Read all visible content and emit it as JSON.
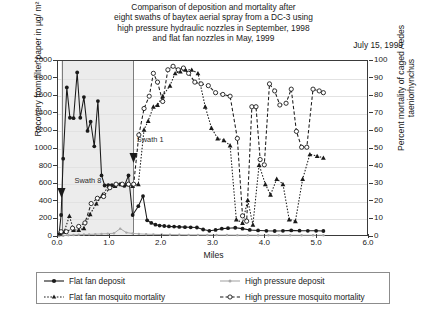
{
  "title": {
    "line1": "Comparison of deposition and mortality after",
    "line2": "eight swaths of baytex aerial spray from a DC-3 using",
    "line3": "high pressure hydraulic nozzles in September, 1998",
    "line4": "and flat fan nozzles in May, 1999"
  },
  "date_label": "July 15, 1999",
  "annotations": [
    {
      "text": "Swath 8",
      "x": 0.32,
      "y": 640
    },
    {
      "text": "Swath 1",
      "x": 1.52,
      "y": 1100
    }
  ],
  "legend": {
    "items": [
      {
        "label": "Flat fan deposit",
        "key": "solid-filled-circle",
        "color": "#1a1a1a"
      },
      {
        "label": "High pressure deposit",
        "key": "solid-grey-dot",
        "color": "#a8a8a8"
      },
      {
        "label": "Flat fan mosquito mortality",
        "key": "dotted-filled-triangle",
        "color": "#1a1a1a"
      },
      {
        "label": "High pressure mosquito mortality",
        "key": "dashed-open-circle",
        "color": "#1a1a1a"
      }
    ]
  },
  "chart_data": {
    "type": "line",
    "title": "Comparison of deposition and mortality after eight swaths of baytex aerial spray from a DC-3 using high pressure hydraulic nozzles in September, 1998 and flat fan nozzles in May, 1999",
    "xlabel": "Miles",
    "ylabel": "Recovery from filter paper in µg/ m²",
    "y2label": "Percent mortality of caged Aedes taeniorhynchus",
    "xlim": [
      0.0,
      6.0
    ],
    "ylim": [
      0,
      2000
    ],
    "y2lim": [
      0,
      100
    ],
    "xticks": [
      "0.0",
      "1.0",
      "2.0",
      "3.0",
      "4.0",
      "5.0",
      "6.0"
    ],
    "yticks": [
      0,
      200,
      400,
      600,
      800,
      1000,
      1200,
      1400,
      1600,
      1800,
      2000
    ],
    "y2ticks": [
      0,
      10,
      20,
      30,
      40,
      50,
      60,
      70,
      80,
      90,
      100
    ],
    "grid": true,
    "legend_position": "below",
    "shaded_band": {
      "x0": 0.05,
      "x1": 1.45,
      "color": "#ececec"
    },
    "swath_markers": [
      {
        "label": "Swath 8",
        "x": 0.07
      },
      {
        "label": "Swath 1",
        "x": 1.45
      }
    ],
    "series": [
      {
        "name": "Flat fan deposit",
        "axis": "left",
        "style": "solid",
        "marker": "filled-circle",
        "color": "#1a1a1a",
        "points": [
          [
            0.02,
            30
          ],
          [
            0.06,
            250
          ],
          [
            0.1,
            890
          ],
          [
            0.17,
            1700
          ],
          [
            0.23,
            1355
          ],
          [
            0.3,
            1350
          ],
          [
            0.37,
            1870
          ],
          [
            0.43,
            1355
          ],
          [
            0.5,
            1590
          ],
          [
            0.57,
            1205
          ],
          [
            0.63,
            1310
          ],
          [
            0.7,
            1030
          ],
          [
            0.77,
            1545
          ],
          [
            0.84,
            700
          ],
          [
            0.9,
            585
          ],
          [
            0.97,
            590
          ],
          [
            1.04,
            590
          ],
          [
            1.12,
            595
          ],
          [
            1.2,
            600
          ],
          [
            1.28,
            580
          ],
          [
            1.36,
            700
          ],
          [
            1.44,
            250
          ],
          [
            1.55,
            350
          ],
          [
            1.64,
            465
          ],
          [
            1.72,
            190
          ],
          [
            1.8,
            160
          ],
          [
            1.88,
            140
          ],
          [
            1.96,
            130
          ],
          [
            2.05,
            125
          ],
          [
            2.14,
            120
          ],
          [
            2.24,
            118
          ],
          [
            2.34,
            115
          ],
          [
            2.45,
            112
          ],
          [
            2.56,
            110
          ],
          [
            2.68,
            108
          ],
          [
            2.8,
            85
          ],
          [
            2.92,
            70
          ],
          [
            3.04,
            80
          ],
          [
            3.16,
            95
          ],
          [
            3.28,
            100
          ],
          [
            3.42,
            105
          ],
          [
            3.56,
            95
          ],
          [
            3.7,
            80
          ],
          [
            3.86,
            75
          ],
          [
            4.02,
            70
          ],
          [
            4.18,
            68
          ],
          [
            4.34,
            70
          ],
          [
            4.5,
            75
          ],
          [
            4.66,
            72
          ],
          [
            4.82,
            70
          ],
          [
            4.98,
            70
          ],
          [
            5.12,
            68
          ]
        ]
      },
      {
        "name": "High pressure deposit",
        "axis": "left",
        "style": "solid",
        "marker": "small-dot",
        "color": "#a8a8a8",
        "points": [
          [
            0.02,
            10
          ],
          [
            0.1,
            15
          ],
          [
            0.2,
            20
          ],
          [
            0.3,
            22
          ],
          [
            0.4,
            25
          ],
          [
            0.5,
            28
          ],
          [
            0.6,
            30
          ],
          [
            0.72,
            32
          ],
          [
            0.84,
            35
          ],
          [
            0.96,
            38
          ],
          [
            1.08,
            42
          ],
          [
            1.2,
            95
          ],
          [
            1.32,
            50
          ],
          [
            1.44,
            40
          ],
          [
            1.56,
            35
          ],
          [
            1.7,
            32
          ],
          [
            1.84,
            30
          ],
          [
            2.0,
            28
          ],
          [
            2.16,
            26
          ],
          [
            2.34,
            25
          ],
          [
            2.52,
            24
          ],
          [
            2.7,
            24
          ],
          [
            2.88,
            23
          ],
          [
            3.06,
            22
          ],
          [
            3.26,
            22
          ],
          [
            3.46,
            21
          ],
          [
            3.66,
            21
          ],
          [
            3.86,
            20
          ],
          [
            4.06,
            20
          ],
          [
            4.26,
            20
          ],
          [
            4.48,
            20
          ],
          [
            4.7,
            20
          ],
          [
            4.92,
            20
          ],
          [
            5.12,
            20
          ]
        ]
      },
      {
        "name": "Flat fan mosquito mortality",
        "axis": "right",
        "style": "dotted",
        "marker": "filled-triangle",
        "color": "#1a1a1a",
        "points": [
          [
            0.04,
            2
          ],
          [
            0.12,
            3
          ],
          [
            0.22,
            12
          ],
          [
            0.3,
            4
          ],
          [
            0.4,
            4
          ],
          [
            0.5,
            5
          ],
          [
            0.62,
            13
          ],
          [
            0.74,
            19
          ],
          [
            0.86,
            24
          ],
          [
            0.98,
            29
          ],
          [
            1.1,
            29
          ],
          [
            1.22,
            30
          ],
          [
            1.34,
            30
          ],
          [
            1.44,
            29
          ],
          [
            1.55,
            30
          ],
          [
            1.66,
            61
          ],
          [
            1.74,
            66
          ],
          [
            1.84,
            74
          ],
          [
            1.92,
            75
          ],
          [
            2.02,
            80
          ],
          [
            2.16,
            86
          ],
          [
            2.26,
            93
          ],
          [
            2.36,
            94
          ],
          [
            2.46,
            95
          ],
          [
            2.58,
            95
          ],
          [
            2.7,
            93
          ],
          [
            2.84,
            74
          ],
          [
            2.96,
            62
          ],
          [
            3.08,
            56
          ],
          [
            3.2,
            55
          ],
          [
            3.32,
            52
          ],
          [
            3.44,
            10
          ],
          [
            3.56,
            8
          ],
          [
            3.66,
            21
          ],
          [
            3.76,
            7
          ],
          [
            3.88,
            41
          ],
          [
            4.0,
            30
          ],
          [
            4.1,
            24
          ],
          [
            4.22,
            33
          ],
          [
            4.34,
            30
          ],
          [
            4.46,
            10
          ],
          [
            4.58,
            9
          ],
          [
            4.72,
            33
          ],
          [
            4.86,
            47
          ],
          [
            5.0,
            46
          ],
          [
            5.12,
            45
          ]
        ]
      },
      {
        "name": "High pressure mosquito mortality",
        "axis": "right",
        "style": "dashed",
        "marker": "open-circle",
        "color": "#1a1a1a",
        "points": [
          [
            0.06,
            3
          ],
          [
            0.16,
            3
          ],
          [
            0.28,
            5
          ],
          [
            0.4,
            6
          ],
          [
            0.52,
            8
          ],
          [
            0.64,
            19
          ],
          [
            0.76,
            22
          ],
          [
            0.88,
            23
          ],
          [
            1.0,
            28
          ],
          [
            1.12,
            30
          ],
          [
            1.24,
            30
          ],
          [
            1.36,
            30
          ],
          [
            1.46,
            30
          ],
          [
            1.56,
            58
          ],
          [
            1.66,
            73
          ],
          [
            1.76,
            80
          ],
          [
            1.84,
            93
          ],
          [
            1.92,
            88
          ],
          [
            2.02,
            77
          ],
          [
            2.12,
            95
          ],
          [
            2.22,
            97
          ],
          [
            2.32,
            95
          ],
          [
            2.42,
            96
          ],
          [
            2.52,
            93
          ],
          [
            2.64,
            88
          ],
          [
            2.76,
            87
          ],
          [
            2.9,
            86
          ],
          [
            3.04,
            82
          ],
          [
            3.18,
            81
          ],
          [
            3.32,
            80
          ],
          [
            3.46,
            56
          ],
          [
            3.56,
            12
          ],
          [
            3.64,
            9
          ],
          [
            3.74,
            74
          ],
          [
            3.82,
            74
          ],
          [
            3.9,
            44
          ],
          [
            3.98,
            41
          ],
          [
            4.08,
            87
          ],
          [
            4.18,
            83
          ],
          [
            4.28,
            75
          ],
          [
            4.4,
            76
          ],
          [
            4.5,
            84
          ],
          [
            4.6,
            60
          ],
          [
            4.7,
            51
          ],
          [
            4.8,
            51
          ],
          [
            4.92,
            84
          ],
          [
            5.04,
            83
          ],
          [
            5.12,
            82
          ]
        ]
      }
    ]
  }
}
